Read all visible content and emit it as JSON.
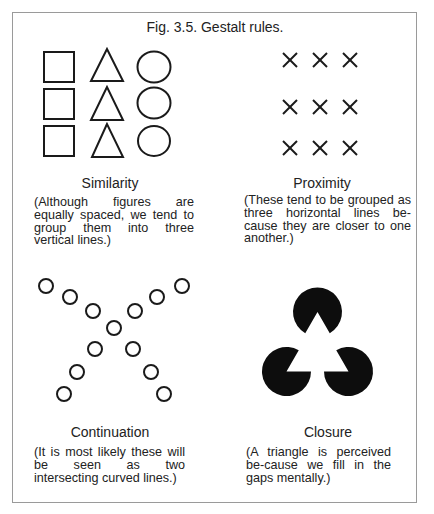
{
  "figure": {
    "title": "Fig. 3.5. Gestalt rules."
  },
  "panels": [
    {
      "id": "similarity",
      "title": "Similarity",
      "description": "(Although figures are equally spaced, we tend to group them into three vertical lines.)",
      "shapes": {
        "columns": [
          "square",
          "triangle",
          "circle"
        ],
        "rows": 3
      }
    },
    {
      "id": "proximity",
      "title": "Proximity",
      "description": "(These tend to be grouped as three horizontal lines be-cause they are closer to one another.)",
      "glyph": "X",
      "grid": {
        "rows": 3,
        "columns": 3
      }
    },
    {
      "id": "continuation",
      "title": "Continuation",
      "description": "(It is most likely these will be seen as two intersecting curved lines.)",
      "circles": 13
    },
    {
      "id": "closure",
      "title": "Closure",
      "description": "(A triangle is perceived be-cause we fill in the gaps mentally.)",
      "pacmen": 3
    }
  ],
  "colors": {
    "ink": "#1a1a1a",
    "frame": "#9a9a9a",
    "background": "#ffffff"
  }
}
